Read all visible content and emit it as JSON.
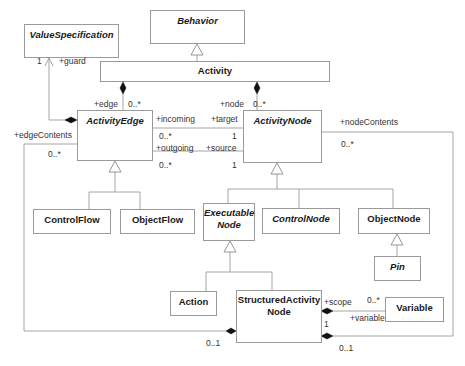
{
  "diagram": {
    "type": "UML class diagram",
    "classes": [
      {
        "id": "behavior",
        "name": "Behavior",
        "abstract": true
      },
      {
        "id": "value_specification",
        "name": "ValueSpecification",
        "abstract": true
      },
      {
        "id": "activity",
        "name": "Activity",
        "abstract": false
      },
      {
        "id": "activity_edge",
        "name": "ActivityEdge",
        "abstract": true
      },
      {
        "id": "activity_node",
        "name": "ActivityNode",
        "abstract": true
      },
      {
        "id": "control_flow",
        "name": "ControlFlow",
        "abstract": false
      },
      {
        "id": "object_flow",
        "name": "ObjectFlow",
        "abstract": false
      },
      {
        "id": "executable_node",
        "name": "Executable Node",
        "name_line1": "Executable",
        "name_line2": "Node",
        "abstract": true
      },
      {
        "id": "control_node",
        "name": "ControlNode",
        "abstract": true
      },
      {
        "id": "object_node",
        "name": "ObjectNode",
        "abstract": false
      },
      {
        "id": "pin",
        "name": "Pin",
        "abstract": true
      },
      {
        "id": "action",
        "name": "Action",
        "abstract": false
      },
      {
        "id": "structured_activity_node",
        "name": "StructuredActivity Node",
        "name_line1": "StructuredActivity",
        "name_line2": "Node",
        "abstract": false
      },
      {
        "id": "variable",
        "name": "Variable",
        "abstract": false
      }
    ],
    "generalizations": [
      {
        "child": "Activity",
        "parent": "Behavior"
      },
      {
        "child": "ControlFlow",
        "parent": "ActivityEdge"
      },
      {
        "child": "ObjectFlow",
        "parent": "ActivityEdge"
      },
      {
        "child": "ExecutableNode",
        "parent": "ActivityNode"
      },
      {
        "child": "ControlNode",
        "parent": "ActivityNode"
      },
      {
        "child": "ObjectNode",
        "parent": "ActivityNode"
      },
      {
        "child": "Pin",
        "parent": "ObjectNode"
      },
      {
        "child": "Action",
        "parent": "ExecutableNode"
      },
      {
        "child": "StructuredActivityNode",
        "parent": "ExecutableNode"
      }
    ],
    "associations": [
      {
        "from": "ActivityEdge",
        "to": "ValueSpecification",
        "role": "+guard",
        "multiplicity": "1",
        "kind": "composition"
      },
      {
        "from": "Activity",
        "to": "ActivityEdge",
        "role": "+edge",
        "multiplicity": "0..*",
        "kind": "composition"
      },
      {
        "from": "Activity",
        "to": "ActivityNode",
        "role": "+node",
        "multiplicity": "0..*",
        "kind": "composition"
      },
      {
        "from": "ActivityNode",
        "to": "ActivityEdge",
        "role": "+incoming",
        "role_other": "+target",
        "multiplicity": "0..*",
        "multiplicity_other": "1"
      },
      {
        "from": "ActivityNode",
        "to": "ActivityEdge",
        "role": "+outgoing",
        "role_other": "+source",
        "multiplicity": "0..*",
        "multiplicity_other": "1"
      },
      {
        "from": "StructuredActivityNode",
        "to": "ActivityEdge",
        "role": "+edgeContents",
        "multiplicity": "0..*",
        "multiplicity_other": "0..1",
        "kind": "composition"
      },
      {
        "from": "StructuredActivityNode",
        "to": "ActivityNode",
        "role": "+nodeContents",
        "multiplicity": "0..*",
        "multiplicity_other": "0..1",
        "kind": "composition"
      },
      {
        "from": "StructuredActivityNode",
        "to": "Variable",
        "role": "+variable",
        "role_other": "+scope",
        "multiplicity": "0..*",
        "multiplicity_other": "1",
        "kind": "composition"
      }
    ]
  },
  "labels": {
    "guard": "+guard",
    "guard_mult": "1",
    "edge": "+edge",
    "edge_mult": "0..*",
    "node": "+node",
    "node_mult": "0..*",
    "incoming": "+incoming",
    "target": "+target",
    "incoming_mult": "0..*",
    "target_mult": "1",
    "outgoing": "+outgoing",
    "source": "+source",
    "outgoing_mult": "0..*",
    "source_mult": "1",
    "edge_contents": "+edgeContents",
    "edge_contents_mult": "0..*",
    "node_contents": "+nodeContents",
    "node_contents_mult": "0..*",
    "edge_owner_mult": "0..1",
    "node_owner_mult": "0..1",
    "scope": "+scope",
    "scope_mult": "1",
    "variable": "+variable",
    "variable_mult": "0..*"
  }
}
